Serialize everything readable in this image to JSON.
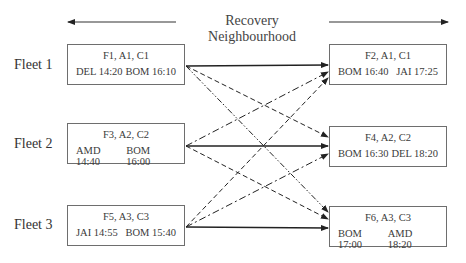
{
  "header": {
    "title": "Recovery Neighbourhood"
  },
  "fleets": [
    {
      "label": "Fleet 1"
    },
    {
      "label": "Fleet 2"
    },
    {
      "label": "Fleet 3"
    }
  ],
  "left_flights": [
    {
      "id": "F1",
      "title": "F1, A1, C1",
      "dep": "DEL 14:20",
      "arr": "BOM 16:10"
    },
    {
      "id": "F3",
      "title": "F3, A2, C2",
      "dep": "AMD 14:40",
      "arr": "BOM 16:00"
    },
    {
      "id": "F5",
      "title": "F5, A3, C3",
      "dep": "JAI 14:55",
      "arr": "BOM 15:40"
    }
  ],
  "right_flights": [
    {
      "id": "F2",
      "title": "F2, A1, C1",
      "dep": "BOM 16:40",
      "arr": "JAI 17:25"
    },
    {
      "id": "F4",
      "title": "F4, A2, C2",
      "dep": "BOM 16:30",
      "arr": "DEL 18:20"
    },
    {
      "id": "F6",
      "title": "F6, A3, C3",
      "dep": "BOM 17:00",
      "arr": "AMD 18:20"
    }
  ],
  "connections": [
    {
      "from": "F1",
      "to": "F2",
      "style": "solid"
    },
    {
      "from": "F1",
      "to": "F4",
      "style": "dashed"
    },
    {
      "from": "F1",
      "to": "F6",
      "style": "dash-dot-dot"
    },
    {
      "from": "F3",
      "to": "F2",
      "style": "dash-dot"
    },
    {
      "from": "F3",
      "to": "F4",
      "style": "solid"
    },
    {
      "from": "F3",
      "to": "F6",
      "style": "dashed"
    },
    {
      "from": "F5",
      "to": "F2",
      "style": "dashed"
    },
    {
      "from": "F5",
      "to": "F4",
      "style": "dash-dot"
    },
    {
      "from": "F5",
      "to": "F6",
      "style": "solid"
    }
  ]
}
